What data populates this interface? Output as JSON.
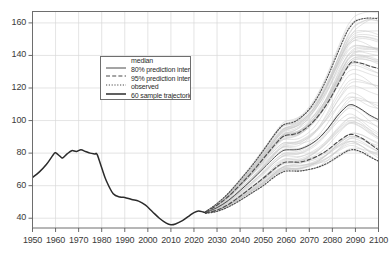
{
  "chart_data": {
    "type": "line",
    "title": "",
    "xlabel": "",
    "ylabel": "",
    "xlim": [
      1950,
      2100
    ],
    "ylim": [
      34,
      167
    ],
    "grid": true,
    "legend_position": "upper-left-inside",
    "xticks": [
      1950,
      1960,
      1970,
      1980,
      1990,
      2000,
      2010,
      2020,
      2030,
      2040,
      2050,
      2060,
      2070,
      2080,
      2090,
      2100
    ],
    "yticks": [
      40,
      60,
      80,
      100,
      120,
      140,
      160
    ],
    "legend": [
      {
        "label": "median",
        "style": "solid",
        "color": "#4a4a4a"
      },
      {
        "label": "80% prediction interval",
        "style": "dashed",
        "color": "#4a4a4a"
      },
      {
        "label": "95% prediction interval",
        "style": "dotted",
        "color": "#4a4a4a"
      },
      {
        "label": "observed",
        "style": "solid-thick",
        "color": "#2b2b2b"
      },
      {
        "label": "60 sample trajectories",
        "style": "solid-light",
        "color": "#c8c8c8"
      }
    ],
    "series": [
      {
        "name": "observed",
        "style": "solid-thick",
        "color": "#2b2b2b",
        "x": [
          1950,
          1953,
          1956,
          1959,
          1960,
          1962,
          1963,
          1965,
          1967,
          1969,
          1971,
          1973,
          1975,
          1977,
          1978,
          1980,
          1982,
          1985,
          1988,
          1990,
          1993,
          1996,
          1999,
          2002,
          2005,
          2008,
          2010,
          2012,
          2015,
          2018,
          2020,
          2022,
          2024,
          2025
        ],
        "values": [
          65.0,
          68.5,
          73.0,
          79.0,
          80.2,
          78.0,
          77.0,
          79.5,
          81.5,
          81.0,
          82.0,
          81.0,
          80.0,
          79.5,
          79.2,
          71.0,
          63.0,
          55.0,
          53.0,
          52.8,
          51.5,
          50.5,
          48.0,
          44.0,
          40.0,
          37.0,
          36.0,
          36.5,
          38.5,
          41.5,
          43.5,
          44.5,
          43.8,
          43.5
        ]
      },
      {
        "name": "median",
        "style": "solid",
        "color": "#4a4a4a",
        "x": [
          2025,
          2030,
          2035,
          2040,
          2045,
          2050,
          2055,
          2058,
          2060,
          2063,
          2066,
          2070,
          2074,
          2078,
          2082,
          2086,
          2088,
          2090,
          2093,
          2096,
          2100
        ],
        "values": [
          43.5,
          46.5,
          51.0,
          57.0,
          63.5,
          70.5,
          77.5,
          81.0,
          82.0,
          82.0,
          82.5,
          85.0,
          89.0,
          95.0,
          102.5,
          108.5,
          109.8,
          109.0,
          106.5,
          103.5,
          100.5
        ]
      },
      {
        "name": "80% prediction interval upper",
        "style": "dashed",
        "color": "#4a4a4a",
        "x": [
          2025,
          2030,
          2035,
          2040,
          2045,
          2050,
          2055,
          2058,
          2060,
          2063,
          2066,
          2070,
          2074,
          2078,
          2082,
          2086,
          2088,
          2090,
          2093,
          2096,
          2100
        ],
        "values": [
          43.8,
          48.0,
          53.5,
          60.5,
          68.0,
          76.5,
          85.0,
          89.5,
          91.0,
          91.5,
          93.0,
          97.0,
          103.0,
          111.0,
          121.0,
          131.5,
          135.5,
          136.0,
          135.0,
          133.5,
          132.0
        ]
      },
      {
        "name": "80% prediction interval lower",
        "style": "dashed",
        "color": "#4a4a4a",
        "x": [
          2025,
          2030,
          2035,
          2040,
          2045,
          2050,
          2055,
          2058,
          2060,
          2063,
          2066,
          2070,
          2074,
          2078,
          2082,
          2086,
          2088,
          2090,
          2093,
          2096,
          2100
        ],
        "values": [
          43.2,
          45.0,
          48.5,
          53.5,
          59.0,
          64.5,
          70.5,
          73.5,
          74.5,
          74.5,
          74.5,
          76.0,
          78.5,
          82.0,
          86.5,
          90.5,
          91.5,
          91.0,
          89.0,
          86.0,
          82.0
        ]
      },
      {
        "name": "95% prediction interval upper",
        "style": "dotted",
        "color": "#4a4a4a",
        "x": [
          2025,
          2030,
          2035,
          2040,
          2045,
          2050,
          2055,
          2058,
          2060,
          2063,
          2066,
          2070,
          2074,
          2078,
          2082,
          2086,
          2088,
          2090,
          2093,
          2096,
          2100
        ],
        "values": [
          44.0,
          49.0,
          55.5,
          63.5,
          72.0,
          81.5,
          91.5,
          96.5,
          98.0,
          99.0,
          101.5,
          107.0,
          115.5,
          127.0,
          140.5,
          153.5,
          158.0,
          161.0,
          162.5,
          163.0,
          162.5
        ]
      },
      {
        "name": "95% prediction interval lower",
        "style": "dotted",
        "color": "#4a4a4a",
        "x": [
          2025,
          2030,
          2035,
          2040,
          2045,
          2050,
          2055,
          2058,
          2060,
          2063,
          2066,
          2070,
          2074,
          2078,
          2082,
          2086,
          2088,
          2090,
          2093,
          2096,
          2100
        ],
        "values": [
          43.0,
          44.2,
          47.0,
          51.0,
          55.5,
          60.0,
          65.5,
          68.0,
          69.0,
          69.0,
          69.0,
          70.0,
          71.5,
          74.0,
          77.5,
          81.0,
          82.0,
          82.0,
          80.5,
          78.0,
          75.0
        ]
      }
    ],
    "sample_trajectories": {
      "count": 60,
      "color": "#c9c9c9",
      "description": "60 light grey simulated trajectories spanning 2025-2100 between roughly 68 and 165"
    }
  }
}
